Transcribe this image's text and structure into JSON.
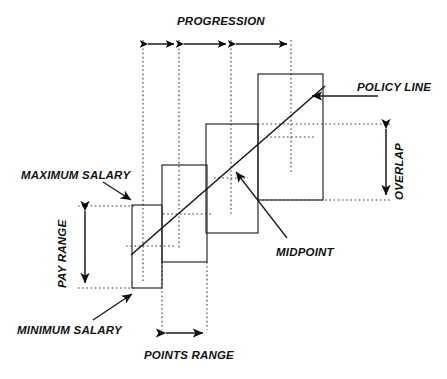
{
  "diagram": {
    "labels": {
      "progression": "PROGRESSION",
      "policy_line": "POLICY LINE",
      "overlap": "OVERLAP",
      "maximum_salary": "MAXIMUM SALARY",
      "minimum_salary": "MINIMUM SALARY",
      "pay_range": "PAY RANGE",
      "midpoint": "MIDPOINT",
      "points_range": "POINTS RANGE"
    },
    "colors": {
      "background": "#ffffff",
      "box_stroke": "#2b2b2b",
      "dotted_stroke": "#3a3a3a",
      "line_stroke": "#1a1a1a",
      "text": "#111111"
    },
    "grades": [
      {
        "name": "grade-1",
        "x1": 132,
        "x2": 162,
        "top": 205,
        "bottom": 288,
        "midpoint_y": 246
      },
      {
        "name": "grade-2",
        "x1": 162,
        "x2": 207,
        "top": 165,
        "bottom": 262,
        "midpoint_y": 214
      },
      {
        "name": "grade-3",
        "x1": 206,
        "x2": 258,
        "top": 124,
        "bottom": 233,
        "midpoint_y": 178
      },
      {
        "name": "grade-4",
        "x1": 258,
        "x2": 323,
        "top": 74,
        "bottom": 200,
        "midpoint_y": 137
      }
    ],
    "midpoint_guides_x": [
      143,
      179,
      231,
      291
    ],
    "progression_segments": [
      {
        "from": 143,
        "to": 179
      },
      {
        "from": 179,
        "to": 231
      },
      {
        "from": 231,
        "to": 291
      }
    ],
    "overlap_band": {
      "x": 386,
      "top": 124,
      "bottom": 200
    },
    "pay_range_band": {
      "x": 85,
      "top": 206,
      "bottom": 288
    },
    "points_range_band": {
      "y": 333,
      "from": 162,
      "to": 207
    },
    "policy_line": {
      "x1": 131,
      "y1": 255,
      "x2": 325,
      "y2": 86
    }
  }
}
